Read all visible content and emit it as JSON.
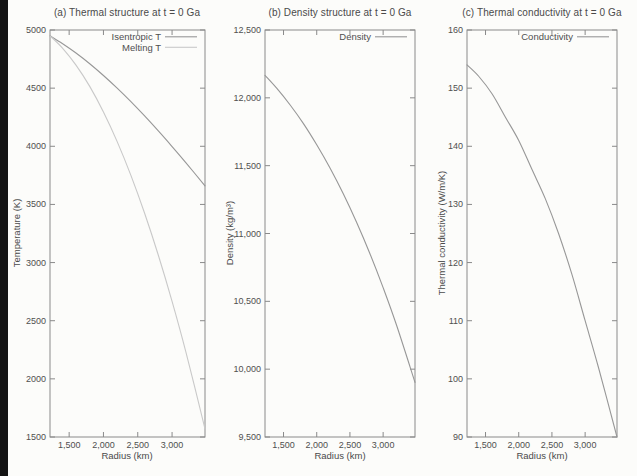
{
  "figure": {
    "background": "#fcfcfa",
    "frame_color": "#8a8a8a",
    "text_color": "#4f4f4f",
    "scan_bar_color": "#141414"
  },
  "chart_data": {
    "type": "line",
    "layout": "three-panel-row",
    "grid": "off",
    "legend_position": "top-right-inside",
    "x": {
      "label": "Radius (km)",
      "min": 1221,
      "max": 3480,
      "tick_values": [
        1500,
        2000,
        2500,
        3000
      ],
      "tick_labels": [
        "1,500",
        "2,000",
        "2,500",
        "3,000"
      ],
      "samples": [
        1221,
        1400,
        1600,
        1800,
        2000,
        2200,
        2400,
        2600,
        2800,
        3000,
        3200,
        3480
      ]
    },
    "panels": [
      {
        "id": "a",
        "title": "(a) Thermal structure at t = 0 Ga",
        "ylabel": "Temperature (K)",
        "ylim": [
          1500,
          5000
        ],
        "ytick_values": [
          1500,
          2000,
          2500,
          3000,
          3500,
          4000,
          4500,
          5000
        ],
        "ytick_labels": [
          "1500",
          "2000",
          "2500",
          "3000",
          "3500",
          "4000",
          "4500",
          "5000"
        ],
        "series": [
          {
            "name": "Isentropic T",
            "color": "#979797",
            "values": [
              4950,
              4884,
              4802,
              4710,
              4609,
              4500,
              4384,
              4261,
              4132,
              3998,
              3860,
              3660
            ]
          },
          {
            "name": "Melting T",
            "color": "#c9c9c9",
            "values": [
              4950,
              4847,
              4698,
              4515,
              4295,
              4040,
              3750,
              3424,
              3063,
              2667,
              2235,
              1570
            ]
          }
        ]
      },
      {
        "id": "b",
        "title": "(b) Density structure at t = 0 Ga",
        "ylabel": "Density (kg/m³)",
        "ylim": [
          9500,
          12500
        ],
        "ytick_values": [
          9500,
          10000,
          10500,
          11000,
          11500,
          12000,
          12500
        ],
        "ytick_labels": [
          "9,500",
          "10,000",
          "10,500",
          "11,000",
          "11,500",
          "12,000",
          "12,500"
        ],
        "series": [
          {
            "name": "Density",
            "color": "#979797",
            "values": [
              12166,
              12069,
              11947,
              11810,
              11654,
              11483,
              11293,
              11083,
              10853,
              10601,
              10327,
              9903
            ]
          }
        ]
      },
      {
        "id": "c",
        "title": "(c) Thermal conductivity at t = 0 Ga",
        "ylabel": "Thermal conductivity (W/m/K)",
        "ylim": [
          90,
          160
        ],
        "ytick_values": [
          90,
          100,
          110,
          120,
          130,
          140,
          150,
          160
        ],
        "ytick_labels": [
          "90",
          "100",
          "110",
          "120",
          "130",
          "140",
          "150",
          "160"
        ],
        "series": [
          {
            "name": "Conductivity",
            "color": "#979797",
            "values": [
              154,
              152,
              149,
              145,
              141,
              136,
              131,
              125,
              118,
              110,
              102,
              90
            ]
          }
        ]
      }
    ]
  }
}
